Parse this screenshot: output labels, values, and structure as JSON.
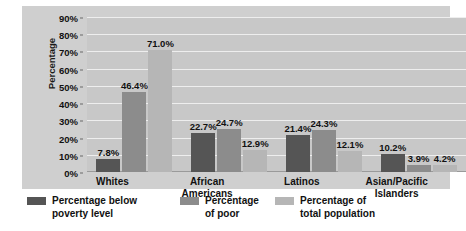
{
  "chart_data": {
    "type": "bar",
    "title": "",
    "xlabel": "",
    "ylabel": "Percentage",
    "ylim": [
      0,
      90
    ],
    "ytick_step": 10,
    "grid": true,
    "legend_position": "bottom",
    "categories": [
      "Whites",
      "African\nAmericans",
      "Latinos",
      "Asian/Pacific\nIslanders"
    ],
    "ytick_labels": [
      "90%",
      "80%",
      "70%",
      "60%",
      "50%",
      "40%",
      "30%",
      "20%",
      "10%",
      "0%"
    ],
    "ytick_values": [
      90,
      80,
      70,
      60,
      50,
      40,
      30,
      20,
      10,
      0
    ],
    "series": [
      {
        "name": "Percentage below\npoverty level",
        "color": "#555555",
        "values": [
          7.8,
          22.7,
          21.4,
          10.2
        ],
        "labels": [
          "7.8%",
          "22.7%",
          "21.4%",
          "10.2%"
        ]
      },
      {
        "name": "Percentage\nof poor",
        "color": "#8c8c8c",
        "values": [
          46.4,
          24.7,
          24.3,
          3.9
        ],
        "labels": [
          "46.4%",
          "24.7%",
          "24.3%",
          "3.9%"
        ]
      },
      {
        "name": "Percentage of\ntotal population",
        "color": "#b6b6b6",
        "values": [
          71.0,
          12.9,
          12.1,
          4.2
        ],
        "labels": [
          "71.0%",
          "12.9%",
          "12.1%",
          "4.2%"
        ]
      }
    ]
  },
  "colors": {
    "panel_background": "#cfcfcf",
    "plot_background": "#c8c8c8",
    "gridline": "#eeeeee",
    "text": "#111111",
    "series_1": "#555555",
    "series_2": "#8c8c8c",
    "series_3": "#b6b6b6"
  }
}
